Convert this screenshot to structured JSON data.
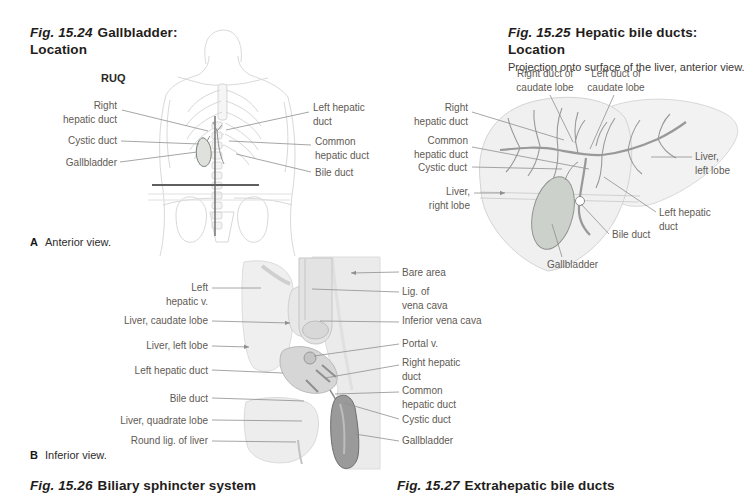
{
  "colors": {
    "background": "#ffffff",
    "caption_text": "#1f1d1b",
    "label_text": "#5f5a54",
    "leader_line": "#8f8f8f",
    "illustration_outline": "#d5d5d5",
    "duct_gray": "#999999",
    "gallbladder_fill": "#cdd1cb",
    "dark_gallbladder": "#9a9a9a"
  },
  "panel_a": {
    "fig_label": "Fig. 15.24",
    "title_line1": "Gallbladder:",
    "title_line2": "Location",
    "quadrant_label": "RUQ",
    "labels_left": {
      "right_hepatic_duct": "Right\nhepatic duct",
      "cystic_duct": "Cystic duct",
      "gallbladder": "Gallbladder"
    },
    "labels_right": {
      "left_hepatic_duct": "Left hepatic\nduct",
      "common_hepatic_duct": "Common\nhepatic duct",
      "bile_duct": "Bile duct"
    },
    "view_letter": "A",
    "view_caption": "Anterior view."
  },
  "panel_fig25": {
    "fig_label": "Fig. 15.25",
    "title": "Hepatic bile ducts: Location",
    "subtitle": "Projection onto surface of the liver, anterior view.",
    "labels": {
      "right_duct_of_caudate_lobe": "Right duct of\ncaudate lobe",
      "left_duct_of_caudate_lobe": "Left duct of\ncaudate lobe",
      "right_hepatic_duct": "Right\nhepatic duct",
      "common_hepatic_duct": "Common\nhepatic duct",
      "cystic_duct": "Cystic duct",
      "liver_right_lobe": "Liver,\nright lobe",
      "liver_left_lobe": "Liver,\nleft lobe",
      "left_hepatic_duct": "Left hepatic\nduct",
      "bile_duct": "Bile duct",
      "gallbladder": "Gallbladder"
    }
  },
  "panel_b": {
    "labels_left": {
      "left_hepatic_v": "Left\nhepatic v.",
      "liver_caudate_lobe": "Liver, caudate lobe",
      "liver_left_lobe": "Liver, left lobe",
      "left_hepatic_duct": "Left hepatic duct",
      "bile_duct": "Bile duct",
      "liver_quadrate_lobe": "Liver, quadrate lobe",
      "round_lig_of_liver": "Round lig. of liver"
    },
    "labels_right": {
      "bare_area": "Bare area",
      "lig_of_vena_cava": "Lig. of\nvena cava",
      "inferior_vena_cava": "Inferior vena cava",
      "portal_v": "Portal v.",
      "right_hepatic_duct": "Right hepatic\nduct",
      "common_hepatic_duct": "Common\nhepatic duct",
      "cystic_duct": "Cystic duct",
      "gallbladder": "Gallbladder"
    },
    "view_letter": "B",
    "view_caption": "Inferior view."
  },
  "captions_bottom": {
    "fig26_label": "Fig. 15.26",
    "fig26_title": "Biliary sphincter system",
    "fig27_label": "Fig. 15.27",
    "fig27_title": "Extrahepatic bile ducts"
  }
}
